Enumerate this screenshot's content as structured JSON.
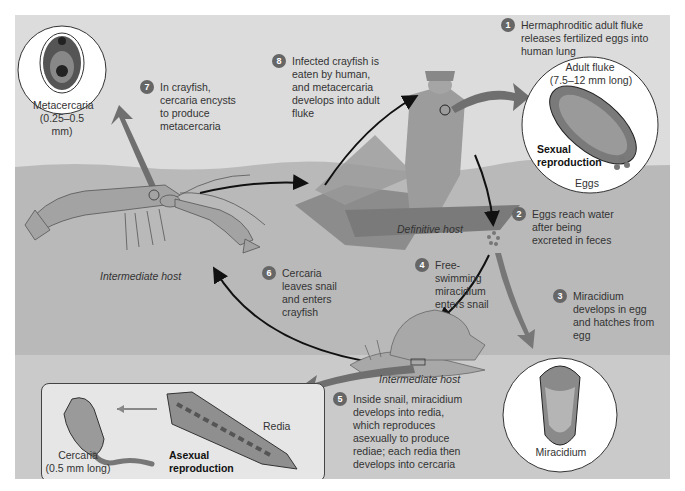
{
  "diagram": {
    "steps": [
      {
        "num": "1",
        "text": "Hermaphroditic adult fluke releases fertilized eggs into human lung"
      },
      {
        "num": "2",
        "text": "Eggs reach water after being excreted in feces"
      },
      {
        "num": "3",
        "text": "Miracidium develops in egg and hatches from egg"
      },
      {
        "num": "4",
        "text": "Free-swimming miracidium enters snail"
      },
      {
        "num": "5",
        "text": "Inside snail, miracidium develops into redia, which reproduces asexually to produce rediae; each redia then develops into cercaria"
      },
      {
        "num": "6",
        "text": "Cercaria leaves snail and enters crayfish"
      },
      {
        "num": "7",
        "text": "In crayfish, cercaria encysts to produce metacercaria"
      },
      {
        "num": "8",
        "text": "Infected crayfish is eaten by human, and metacercaria develops into adult fluke"
      }
    ],
    "labels": {
      "adult_fluke": "Adult fluke",
      "adult_fluke_size": "(7.5–12 mm long)",
      "sexual_1": "Sexual",
      "sexual_2": "reproduction",
      "eggs": "Eggs",
      "definitive_host": "Definitive host",
      "intermediate_host_crayfish": "Intermediate host",
      "intermediate_host_snail": "Intermediate host",
      "metacercaria": "Metacercaria",
      "metacercaria_size": "(0.25–0.5 mm)",
      "miracidium": "Miracidium",
      "redia": "Redia",
      "cercaria": "Cercaria",
      "cercaria_size": "(0.5 mm long)",
      "asexual_1": "Asexual",
      "asexual_2": "reproduction"
    },
    "colors": {
      "panel_bg": "#dcdcdc",
      "water": "#b4b4b4",
      "organism": "#a9a9a9",
      "arrow_black": "#111111",
      "arrow_gray": "#777777",
      "badge": "#666666"
    }
  }
}
